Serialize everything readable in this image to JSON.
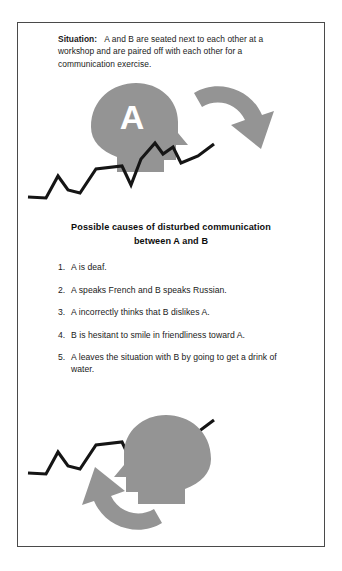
{
  "figure": {
    "situation": {
      "label": "Situation:",
      "body": "A and B are seated next to each other at a workshop and are paired off with each other for a communication exercise."
    },
    "causes": {
      "heading": "Possible causes of disturbed communication between A and B",
      "items": [
        {
          "number": "1.",
          "text": "A is deaf."
        },
        {
          "number": "2.",
          "text": "A speaks French and B speaks Russian."
        },
        {
          "number": "3.",
          "text": "A incorrectly thinks that B dislikes A."
        },
        {
          "number": "4.",
          "text": "B is hesitant to smile in friendliness toward A."
        },
        {
          "number": "5.",
          "text": "A leaves the situation with B by going to get a drink of water."
        }
      ]
    },
    "figures": {
      "head_a_letter": "A",
      "head_b_letter": "B"
    },
    "colors": {
      "gray_fill": "#949494",
      "line_black": "#151515",
      "frame_border": "#4a4a4a",
      "background": "#ffffff",
      "text": "#1a1a1a"
    }
  }
}
